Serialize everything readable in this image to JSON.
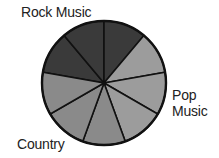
{
  "chart_data": {
    "type": "pie",
    "title": "",
    "slices": [
      {
        "label": "Rock Music",
        "value": 3,
        "segments": 3,
        "color": "#3a3a3a"
      },
      {
        "label": "Pop Music",
        "value": 3,
        "segments": 3,
        "color": "#9c9c9c"
      },
      {
        "label": "Country",
        "value": 3,
        "segments": 3,
        "color": "#8a8a8a"
      }
    ],
    "total_segments": 9,
    "labels": [
      "Rock Music",
      "Pop Music",
      "Country"
    ]
  },
  "labels": {
    "rock": "Rock Music",
    "pop_line1": "Pop",
    "pop_line2": "Music",
    "country": "Country"
  }
}
